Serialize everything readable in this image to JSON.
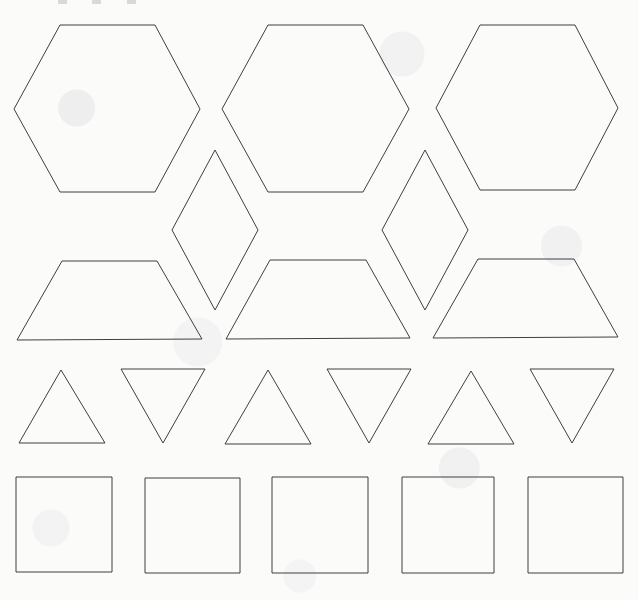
{
  "page": {
    "width": 638,
    "height": 600,
    "background_color": "#fbfbf9",
    "stroke_color": "#3f3f42",
    "stroke_width": 1,
    "fill": "none"
  },
  "artifacts": {
    "top_edge_marks": [
      {
        "name": "crop-mark-left",
        "x": 58,
        "width": 9
      },
      {
        "name": "crop-mark-middle",
        "x": 92,
        "width": 9
      },
      {
        "name": "crop-mark-right",
        "x": 127,
        "width": 9
      }
    ]
  },
  "rows": [
    {
      "name": "hexagon-row",
      "label": "Hexagons",
      "shape_type": "hexagon",
      "count": 3,
      "orientation": "flat-top",
      "y_top": 25,
      "y_bottom": 192,
      "shapes": [
        {
          "name": "hexagon-1",
          "label": "Hexagon 1",
          "points": "60,25 155,25 200,109 155,192 60,192 14,109",
          "bbox": {
            "x": 14,
            "y": 25,
            "width": 186,
            "height": 167
          }
        },
        {
          "name": "hexagon-2",
          "label": "Hexagon 2",
          "points": "268,25 363,25 409,109 363,192 268,192 222,109",
          "bbox": {
            "x": 222,
            "y": 25,
            "width": 187,
            "height": 167
          }
        },
        {
          "name": "hexagon-3",
          "label": "Hexagon 3",
          "points": "480,25 575,25 618,108 575,190 480,190 436,108",
          "bbox": {
            "x": 436,
            "y": 25,
            "width": 182,
            "height": 165
          }
        }
      ]
    },
    {
      "name": "rhombus-row",
      "label": "Rhombuses",
      "shape_type": "rhombus",
      "count": 2,
      "orientation": "vertical-long-axis",
      "y_top": 150,
      "y_bottom": 310,
      "shapes": [
        {
          "name": "rhombus-1",
          "label": "Rhombus 1",
          "points": "215,150 258,230 215,310 172,230",
          "bbox": {
            "x": 172,
            "y": 150,
            "width": 86,
            "height": 160
          }
        },
        {
          "name": "rhombus-2",
          "label": "Rhombus 2",
          "points": "425,150 468,230 425,310 382,230",
          "bbox": {
            "x": 382,
            "y": 150,
            "width": 86,
            "height": 160
          }
        }
      ]
    },
    {
      "name": "trapezoid-row",
      "label": "Trapezoids",
      "shape_type": "trapezoid",
      "count": 3,
      "orientation": "short-side-up",
      "y_top": 260,
      "y_bottom": 340,
      "shapes": [
        {
          "name": "trapezoid-1",
          "label": "Trapezoid 1",
          "points": "62,261 157,261 202,339 17,340",
          "bbox": {
            "x": 17,
            "y": 261,
            "width": 185,
            "height": 79
          }
        },
        {
          "name": "trapezoid-2",
          "label": "Trapezoid 2",
          "points": "270,260 366,260 410,338 226,339",
          "bbox": {
            "x": 226,
            "y": 260,
            "width": 184,
            "height": 79
          }
        },
        {
          "name": "trapezoid-3",
          "label": "Trapezoid 3",
          "points": "478,259 574,259 618,337 433,338",
          "bbox": {
            "x": 433,
            "y": 259,
            "width": 185,
            "height": 79
          }
        }
      ]
    },
    {
      "name": "triangle-row",
      "label": "Triangles",
      "shape_type": "triangle",
      "count": 6,
      "orientation": "alternating-up-down",
      "y_top": 369,
      "y_bottom": 444,
      "shapes": [
        {
          "name": "triangle-1-up",
          "label": "Triangle 1 (point up)",
          "direction": "up",
          "points": "61,370 105,443 19,443",
          "bbox": {
            "x": 19,
            "y": 370,
            "width": 86,
            "height": 73
          }
        },
        {
          "name": "triangle-2-down",
          "label": "Triangle 2 (point down)",
          "direction": "down",
          "points": "121,369 205,369 163,443",
          "bbox": {
            "x": 121,
            "y": 369,
            "width": 84,
            "height": 74
          }
        },
        {
          "name": "triangle-3-up",
          "label": "Triangle 3 (point up)",
          "direction": "up",
          "points": "268,370 311,444 225,444",
          "bbox": {
            "x": 225,
            "y": 370,
            "width": 86,
            "height": 74
          }
        },
        {
          "name": "triangle-4-down",
          "label": "Triangle 4 (point down)",
          "direction": "down",
          "points": "327,369 411,369 369,443",
          "bbox": {
            "x": 327,
            "y": 369,
            "width": 84,
            "height": 74
          }
        },
        {
          "name": "triangle-5-up",
          "label": "Triangle 5 (point up)",
          "direction": "up",
          "points": "471,371 514,444 428,444",
          "bbox": {
            "x": 428,
            "y": 371,
            "width": 86,
            "height": 73
          }
        },
        {
          "name": "triangle-6-down",
          "label": "Triangle 6 (point down)",
          "direction": "down",
          "points": "530,369 614,369 572,443",
          "bbox": {
            "x": 530,
            "y": 369,
            "width": 84,
            "height": 74
          }
        }
      ]
    },
    {
      "name": "square-row",
      "label": "Squares",
      "shape_type": "square",
      "count": 5,
      "orientation": "axis-aligned",
      "y_top": 477,
      "y_bottom": 572,
      "note": "bottom row is clipped by the page edge",
      "shapes": [
        {
          "name": "square-1",
          "label": "Square 1",
          "points": "16,477 112,477 112,572 16,572",
          "bbox": {
            "x": 16,
            "y": 477,
            "width": 96,
            "height": 95
          }
        },
        {
          "name": "square-2",
          "label": "Square 2",
          "points": "145,478 240,478 240,573 145,573",
          "bbox": {
            "x": 145,
            "y": 478,
            "width": 95,
            "height": 95
          }
        },
        {
          "name": "square-3",
          "label": "Square 3",
          "points": "272,477 368,477 368,573 272,573",
          "bbox": {
            "x": 272,
            "y": 477,
            "width": 96,
            "height": 96
          }
        },
        {
          "name": "square-4",
          "label": "Square 4",
          "points": "402,477 494,477 494,573 402,573",
          "bbox": {
            "x": 402,
            "y": 477,
            "width": 92,
            "height": 96
          }
        },
        {
          "name": "square-5",
          "label": "Square 5",
          "points": "528,477 623,477 623,573 528,573",
          "bbox": {
            "x": 528,
            "y": 477,
            "width": 95,
            "height": 96
          }
        }
      ]
    }
  ]
}
